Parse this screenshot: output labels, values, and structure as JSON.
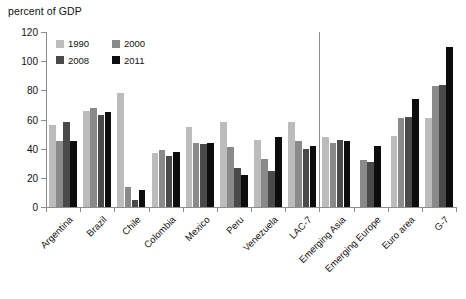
{
  "chart_data": {
    "type": "bar",
    "title": "",
    "ylabel": "percent of GDP",
    "xlabel": "",
    "ylim": [
      0,
      120
    ],
    "yticks": [
      0,
      20,
      40,
      60,
      80,
      100,
      120
    ],
    "grid": false,
    "legend_position": "top-left",
    "categories": [
      "Argentina",
      "Brazil",
      "Chile",
      "Colombia",
      "Mexico",
      "Peru",
      "Venezuela",
      "LAC-7",
      "Emerging Asia",
      "Emerging Europe",
      "Euro area",
      "G-7"
    ],
    "series": [
      {
        "name": "1990",
        "color": "#bcbcbc",
        "values": [
          56,
          66,
          78,
          37,
          55,
          58,
          46,
          58,
          48,
          null,
          49,
          61
        ]
      },
      {
        "name": "2000",
        "color": "#8a8a8a",
        "values": [
          45,
          68,
          14,
          39,
          44,
          41,
          33,
          45,
          44,
          32,
          61,
          83
        ]
      },
      {
        "name": "2008",
        "color": "#4a4a4a",
        "values": [
          58,
          63,
          5,
          35,
          43,
          27,
          25,
          40,
          46,
          31,
          62,
          84
        ]
      },
      {
        "name": "2011",
        "color": "#0d0d0d",
        "values": [
          45,
          65,
          12,
          38,
          44,
          22,
          48,
          42,
          45,
          42,
          74,
          110
        ]
      }
    ],
    "annotations": {
      "divider_after_category": "LAC-7"
    }
  },
  "legend": {
    "items": [
      {
        "label": "1990",
        "swatch": "#bcbcbc"
      },
      {
        "label": "2000",
        "swatch": "#8a8a8a"
      },
      {
        "label": "2008",
        "swatch": "#4a4a4a"
      },
      {
        "label": "2011",
        "swatch": "#0d0d0d"
      }
    ]
  },
  "axis": {
    "caption": "percent of GDP"
  }
}
